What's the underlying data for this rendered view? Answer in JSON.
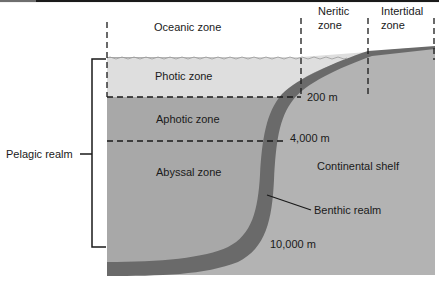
{
  "diagram": {
    "zones_top": {
      "oceanic": "Oceanic zone",
      "neritic_line1": "Neritic",
      "neritic_line2": "zone",
      "intertidal_line1": "Intertidal",
      "intertidal_line2": "zone"
    },
    "zones_depth": {
      "photic": "Photic zone",
      "aphotic": "Aphotic zone",
      "abyssal": "Abyssal zone"
    },
    "depth_markers": {
      "d200": "200 m",
      "d4000": "4,000 m",
      "d10000": "10,000 m"
    },
    "realms": {
      "pelagic": "Pelagic realm",
      "benthic": "Benthic realm"
    },
    "landform": {
      "shelf": "Continental shelf"
    },
    "colors": {
      "background": "#ffffff",
      "photic_fill": "#dcdcdc",
      "deep_fill": "#a9a9a9",
      "shelf_fill": "#b0b0b0",
      "benthic_band": "#6b6b6b",
      "line": "#1a1a1a"
    }
  }
}
